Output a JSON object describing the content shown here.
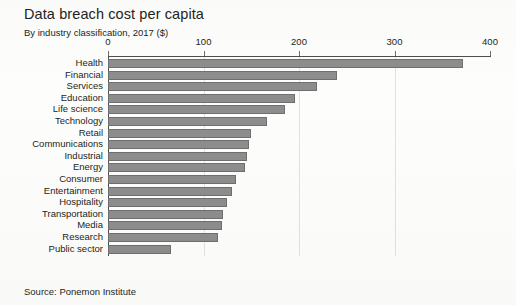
{
  "header": {
    "title": "Data breach cost per capita",
    "subtitle": "By industry classification, 2017 ($)"
  },
  "footer": {
    "source": "Source: Ponemon Institute"
  },
  "style": {
    "bar_fill": "#8d8d8d",
    "bar_stroke": "#6f6f6f",
    "axis_color": "#4d4d4d",
    "grid_color": "#e2e2e0",
    "text_color": "#231f20",
    "background": "#fdfdfc"
  },
  "chart_data": {
    "type": "bar",
    "orientation": "horizontal",
    "title": "Data breach cost per capita",
    "subtitle": "By industry classification, 2017 ($)",
    "xlabel": "",
    "ylabel": "",
    "xlim": [
      0,
      400
    ],
    "xticks": [
      0,
      100,
      200,
      300,
      400
    ],
    "xtick_labels": [
      "0",
      "100",
      "200",
      "300",
      "400"
    ],
    "grid": "vertical-faint",
    "legend": "none",
    "axis_position": "top",
    "source": "Source: Ponemon Institute",
    "categories": [
      "Health",
      "Financial",
      "Services",
      "Education",
      "Life science",
      "Technology",
      "Retail",
      "Communications",
      "Industrial",
      "Energy",
      "Consumer",
      "Entertainment",
      "Hospitality",
      "Transportation",
      "Media",
      "Research",
      "Public sector"
    ],
    "values": [
      372,
      240,
      219,
      196,
      185,
      167,
      150,
      148,
      146,
      143,
      134,
      130,
      125,
      120,
      119,
      115,
      66
    ]
  }
}
